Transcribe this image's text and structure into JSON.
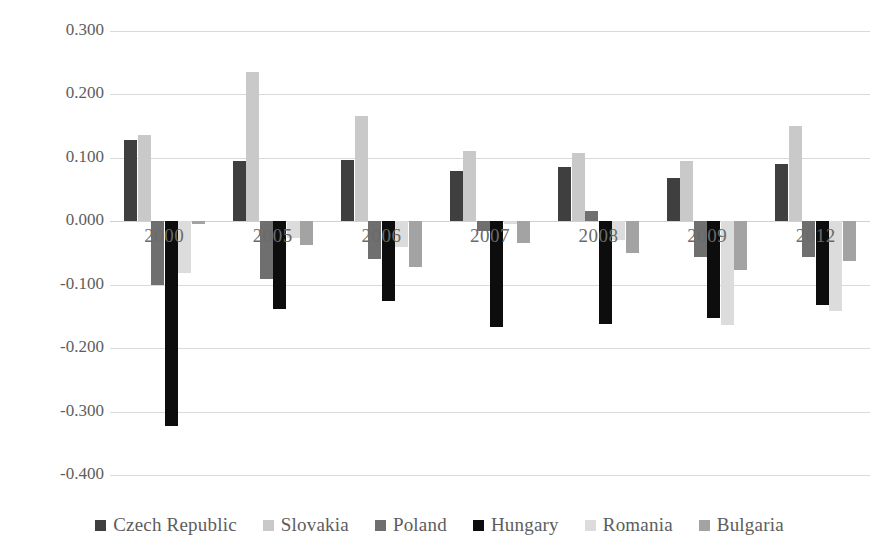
{
  "chart_data": {
    "type": "bar",
    "title": "",
    "xlabel": "",
    "ylabel": "RCA index",
    "categories": [
      "2000",
      "2005",
      "2006",
      "2007",
      "2008",
      "2009",
      "2012"
    ],
    "ylim": [
      -0.4,
      0.3
    ],
    "ytick_labels": [
      "0.300",
      "0.200",
      "0.100",
      "0.000",
      "-0.100",
      "-0.200",
      "-0.300",
      "-0.400"
    ],
    "ytick_values": [
      0.3,
      0.2,
      0.1,
      0.0,
      -0.1,
      -0.2,
      -0.3,
      -0.4
    ],
    "grid": true,
    "legend_position": "bottom",
    "series": [
      {
        "name": "Czech Republic",
        "color": "#3f3f3f",
        "values": [
          0.128,
          0.095,
          0.096,
          0.079,
          0.085,
          0.069,
          0.091
        ]
      },
      {
        "name": "Slovakia",
        "color": "#c9c9c9",
        "values": [
          0.136,
          0.235,
          0.166,
          0.111,
          0.107,
          0.095,
          0.151
        ]
      },
      {
        "name": "Poland",
        "color": "#6f6f6f",
        "values": [
          -0.1,
          -0.091,
          -0.06,
          -0.015,
          0.016,
          -0.057,
          -0.056
        ]
      },
      {
        "name": "Hungary",
        "color": "#0d0d0d",
        "values": [
          -0.322,
          -0.139,
          -0.126,
          -0.166,
          -0.162,
          -0.153,
          -0.132
        ]
      },
      {
        "name": "Romania",
        "color": "#dcdcdc",
        "values": [
          -0.081,
          -0.026,
          -0.04,
          -0.005,
          -0.03,
          -0.163,
          -0.142
        ]
      },
      {
        "name": "Bulgaria",
        "color": "#a3a3a3",
        "values": [
          -0.004,
          -0.038,
          -0.072,
          -0.035,
          -0.05,
          -0.077,
          -0.063
        ]
      }
    ]
  }
}
